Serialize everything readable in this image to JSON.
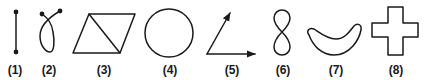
{
  "figures": [
    {
      "id": 1,
      "label": "(1)",
      "shape": "line-segment-with-endpoints"
    },
    {
      "id": 2,
      "label": "(2)",
      "shape": "crossed-loop-with-endpoints"
    },
    {
      "id": 3,
      "label": "(3)",
      "shape": "parallelogram-with-diagonal"
    },
    {
      "id": 4,
      "label": "(4)",
      "shape": "circle"
    },
    {
      "id": 5,
      "label": "(5)",
      "shape": "angle-with-arrow-rays"
    },
    {
      "id": 6,
      "label": "(6)",
      "shape": "figure-eight"
    },
    {
      "id": 7,
      "label": "(7)",
      "shape": "banana-curve"
    },
    {
      "id": 8,
      "label": "(8)",
      "shape": "plus-cross"
    }
  ],
  "colors": {
    "ink": "#1a1a1a",
    "background": "#ffffff"
  }
}
